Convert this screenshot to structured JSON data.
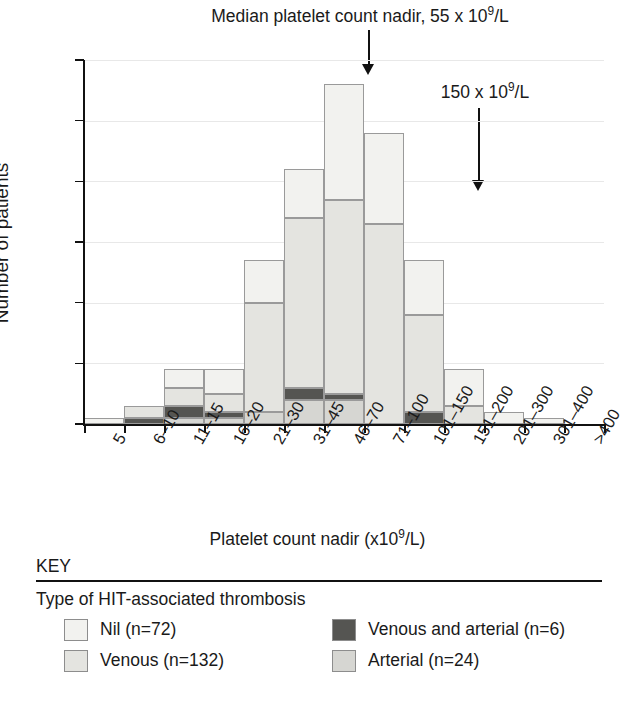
{
  "annotations": {
    "median_prefix": "Median platelet count nadir, 55 x 10",
    "median_sup": "9",
    "median_suffix": "/L",
    "threshold_prefix": "150 x 10",
    "threshold_sup": "9",
    "threshold_suffix": "/L"
  },
  "axis": {
    "ylabel": "Number of patients",
    "xlabel_prefix": "Platelet count nadir (x10",
    "xlabel_sup": "9",
    "xlabel_suffix": "/L)"
  },
  "key": {
    "heading": "KEY",
    "subheading": "Type of HIT-associated thrombosis",
    "items": [
      {
        "label": "Nil (n=72)",
        "color": "#f2f2ef"
      },
      {
        "label": "Venous and arterial (n=6)",
        "color": "#555552"
      },
      {
        "label": "Venous (n=132)",
        "color": "#e4e4e0"
      },
      {
        "label": "Arterial (n=24)",
        "color": "#d6d6d2"
      }
    ]
  },
  "chart_data": {
    "type": "bar",
    "xlabel": "Platelet count nadir (x10⁹/L)",
    "ylabel": "Number of patients",
    "ylim": [
      0,
      60
    ],
    "yticks": [
      0,
      10,
      20,
      30,
      40,
      50,
      60
    ],
    "grid": true,
    "stacked": true,
    "legend_position": "bottom",
    "categories": [
      "5",
      "6–10",
      "11–15",
      "16–20",
      "21–30",
      "31–45",
      "46–70",
      "71–100",
      "101–150",
      "151–200",
      "201–300",
      "301–400",
      ">400"
    ],
    "series": [
      {
        "name": "Arterial (n=24)",
        "color": "#d6d6d2",
        "values": [
          0,
          0,
          1,
          1,
          2,
          4,
          4,
          0,
          0,
          0,
          0,
          0,
          0
        ]
      },
      {
        "name": "Venous and arterial (n=6)",
        "color": "#555552",
        "values": [
          0,
          1,
          2,
          1,
          0,
          2,
          1,
          0,
          2,
          0,
          0,
          0,
          0
        ]
      },
      {
        "name": "Venous (n=132)",
        "color": "#e4e4e0",
        "values": [
          0,
          2,
          3,
          3,
          18,
          28,
          32,
          33,
          16,
          3,
          0,
          0,
          0
        ]
      },
      {
        "name": "Nil (n=72)",
        "color": "#f2f2ef",
        "values": [
          1,
          0,
          3,
          4,
          7,
          8,
          19,
          15,
          9,
          6,
          2,
          1,
          0
        ]
      }
    ],
    "totals": [
      1,
      3,
      9,
      9,
      27,
      42,
      56,
      48,
      27,
      9,
      2,
      1,
      0
    ],
    "annotations": [
      {
        "text": "Median platelet count nadir, 55 x 10⁹/L",
        "at_category": "46–70"
      },
      {
        "text": "150 x 10⁹/L",
        "at_category": "101–150"
      }
    ]
  }
}
